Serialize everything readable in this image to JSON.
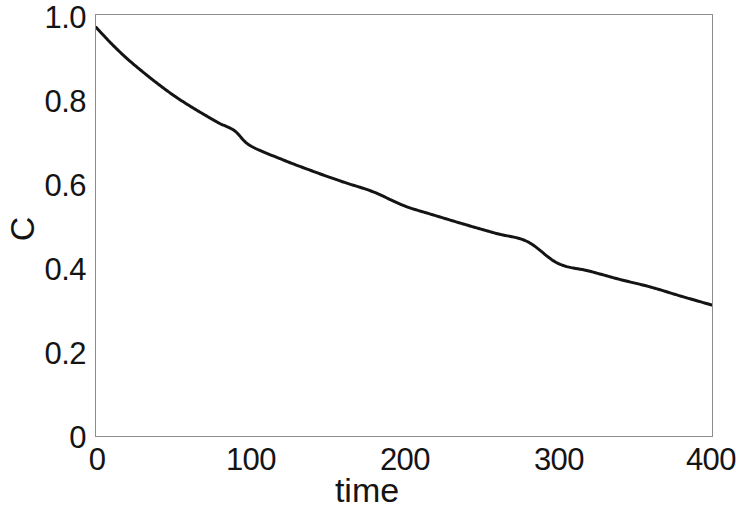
{
  "chart_data": {
    "type": "line",
    "title": "",
    "subtitle": "",
    "xlabel": "time",
    "ylabel": "C",
    "xlim": [
      0,
      400
    ],
    "ylim": [
      0,
      1.0
    ],
    "grid": false,
    "legend": null,
    "legend_position": "none",
    "x_ticks": [
      "0",
      "100",
      "200",
      "300",
      "400"
    ],
    "x_tick_values": [
      0,
      100,
      200,
      300,
      400
    ],
    "y_ticks": [
      "0",
      "0.2",
      "0.4",
      "0.6",
      "0.8",
      "1.0"
    ],
    "y_tick_values": [
      0,
      0.2,
      0.4,
      0.6,
      0.8,
      1.0
    ],
    "series": [
      {
        "name": "C",
        "color": "#141414",
        "line_width": 3,
        "x": [
          0,
          10,
          20,
          30,
          40,
          50,
          60,
          70,
          80,
          90,
          100,
          120,
          140,
          160,
          180,
          200,
          220,
          240,
          260,
          280,
          300,
          320,
          340,
          360,
          380,
          400
        ],
        "values": [
          0.971,
          0.932,
          0.897,
          0.866,
          0.837,
          0.81,
          0.786,
          0.764,
          0.743,
          0.725,
          0.69,
          0.658,
          0.63,
          0.604,
          0.58,
          0.547,
          0.524,
          0.502,
          0.481,
          0.462,
          0.41,
          0.392,
          0.372,
          0.354,
          0.332,
          0.311
        ]
      }
    ],
    "annotations": []
  },
  "axes": {
    "y_tick_labels": [
      {
        "text": "1.0",
        "value": 1.0
      },
      {
        "text": "0.8",
        "value": 0.8
      },
      {
        "text": "0.6",
        "value": 0.6
      },
      {
        "text": "0.4",
        "value": 0.4
      },
      {
        "text": "0.2",
        "value": 0.2
      },
      {
        "text": "0",
        "value": 0
      }
    ],
    "x_tick_labels": [
      {
        "text": "0",
        "value": 0
      },
      {
        "text": "100",
        "value": 100
      },
      {
        "text": "200",
        "value": 200
      },
      {
        "text": "300",
        "value": 300
      },
      {
        "text": "400",
        "value": 400
      }
    ],
    "x_title": "time",
    "y_title": "C"
  },
  "style": {
    "background": "#ffffff",
    "frame_color": "#8c8c8c",
    "curve_color": "#141414",
    "text_color": "#141414"
  }
}
